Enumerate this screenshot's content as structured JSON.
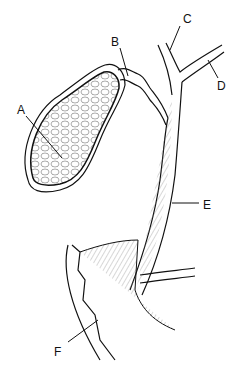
{
  "diagram": {
    "labels": [
      {
        "id": "A",
        "text": "A",
        "x": 17,
        "y": 104
      },
      {
        "id": "B",
        "text": "B",
        "x": 111,
        "y": 36
      },
      {
        "id": "C",
        "text": "C",
        "x": 183,
        "y": 13
      },
      {
        "id": "D",
        "text": "D",
        "x": 217,
        "y": 80
      },
      {
        "id": "E",
        "text": "E",
        "x": 203,
        "y": 199
      },
      {
        "id": "F",
        "text": "F",
        "x": 54,
        "y": 346
      }
    ],
    "colors": {
      "ink": "#111111",
      "background": "#ffffff",
      "shade": "#dddddd"
    }
  }
}
